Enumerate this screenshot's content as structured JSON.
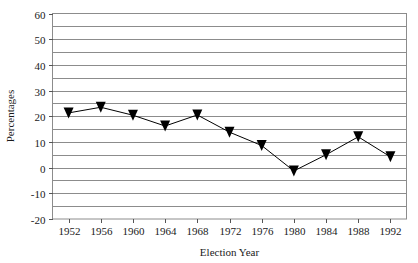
{
  "chart_data": {
    "type": "line",
    "title": "",
    "subtitle": "",
    "xlabel": "Election Year",
    "ylabel": "Percentages",
    "categories": [
      "1952",
      "1956",
      "1960",
      "1964",
      "1968",
      "1972",
      "1976",
      "1980",
      "1984",
      "1988",
      "1992"
    ],
    "x": [
      1952,
      1956,
      1960,
      1964,
      1968,
      1972,
      1976,
      1980,
      1984,
      1988,
      1992
    ],
    "values": [
      21.3,
      23.5,
      20.4,
      16.2,
      20.5,
      13.8,
      8.6,
      -1.3,
      5.0,
      12.0,
      4.2
    ],
    "series": [
      {
        "name": "Percentages",
        "values": [
          21.3,
          23.5,
          20.4,
          16.2,
          20.5,
          13.8,
          8.6,
          -1.3,
          5.0,
          12.0,
          4.2
        ],
        "marker": "triangle-down",
        "marker_color": "#000000",
        "line_color": "#000000"
      }
    ],
    "ylim": [
      -20,
      60
    ],
    "ytick_labels": [
      "60",
      "50",
      "40",
      "30",
      "20",
      "10",
      "0",
      "-10",
      "-20"
    ],
    "ytick_values": [
      60,
      50,
      40,
      30,
      20,
      10,
      0,
      -10,
      -20
    ],
    "yminor_values": [
      55,
      45,
      35,
      25,
      15,
      5,
      -5,
      -15
    ],
    "grid": true,
    "grid_orientation": "horizontal",
    "grid_color": "#8c8c8c",
    "legend": false,
    "legend_position": "none",
    "plot_border_color": "#8c8c8c",
    "background_color": "#ffffff"
  }
}
